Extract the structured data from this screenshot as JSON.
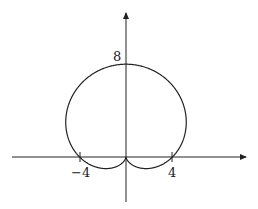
{
  "chart_data": {
    "type": "line",
    "subtype": "polar",
    "title": "",
    "equation": "r = 4 + 4 sin(theta)",
    "xlabel": "",
    "ylabel": "",
    "x_tick_labels": [
      "-4",
      "4"
    ],
    "x_ticks": [
      -4,
      4
    ],
    "y_tick_labels": [
      "8"
    ],
    "y_ticks": [
      8
    ],
    "xlim": [
      -10,
      10.5
    ],
    "ylim": [
      -3.9,
      12.3
    ],
    "grid": false,
    "legend": null,
    "key_points": [
      {
        "x": 0,
        "y": 8
      },
      {
        "x": -4,
        "y": 0
      },
      {
        "x": 4,
        "y": 0
      },
      {
        "x": 0,
        "y": 0
      }
    ],
    "series": [
      {
        "name": "cardioid",
        "color": "#222222"
      }
    ]
  },
  "labels": {
    "y8": "8",
    "xneg4": "−4",
    "xpos4": "4"
  }
}
